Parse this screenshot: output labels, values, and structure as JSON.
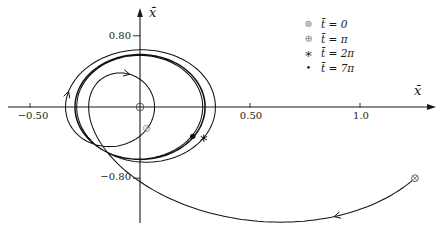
{
  "figure": {
    "background": "#ffffff",
    "ink_color": "#1a1a1a",
    "muted_color": "#8a8a8a"
  },
  "chart_data": {
    "type": "line",
    "subtype": "phase-plane-trajectory",
    "title": "",
    "xlabel": "x̄",
    "ylabel": "x̄̇",
    "xlim": [
      -0.6,
      1.35
    ],
    "ylim": [
      -1.3,
      1.09
    ],
    "grid": false,
    "legend_position": "top-right",
    "x_ticks": [
      {
        "value": -0.5,
        "label": "−0.50"
      },
      {
        "value": 0.5,
        "label": "0.50"
      },
      {
        "value": 1.0,
        "label": "1.0"
      }
    ],
    "y_ticks": [
      {
        "value": 0.8,
        "label": "0.80"
      },
      {
        "value": -0.8,
        "label": "−0.80"
      }
    ],
    "origin_marker": {
      "x": 0,
      "y": 0
    },
    "markers": [
      {
        "symbol": "circle-cross",
        "glyph": "⊗",
        "label": "t̄ = 0",
        "x": 1.25,
        "y": -0.8
      },
      {
        "symbol": "circle-plus",
        "glyph": "⊕",
        "label": "t̄ = π",
        "x": 0.03,
        "y": -0.24
      },
      {
        "symbol": "asterisk",
        "glyph": "∗",
        "label": "t̄ = 2π",
        "x": 0.29,
        "y": -0.35
      },
      {
        "symbol": "dot",
        "glyph": "•",
        "label": "t̄ = 7π",
        "x": 0.24,
        "y": -0.33
      }
    ],
    "trajectory": {
      "description": "Forced damped response: starts at (1.25, -0.80), sweeps along the bottom, loops near the origin, then converges clockwise onto the steady-state ellipse (x-amplitude 0.295, velocity amplitude 0.59) by t = 7π.",
      "steady_state": {
        "amplitude": 0.295,
        "omega": 2,
        "phase": 0.6
      },
      "transient": {
        "amplitude": 1.0066,
        "decay": 0.5,
        "omega_d": 1.0,
        "phase": -0.036
      },
      "t_start": 0,
      "t_end": 21.99,
      "dt": 0.02,
      "flow_arrows_t": [
        0.3,
        2.3,
        4.41
      ],
      "key_points": {
        "start": [
          1.25,
          -0.8
        ],
        "bottom_sweep_lowest": [
          0.65,
          -1.27
        ],
        "outer_loop_leftmost": [
          -0.35,
          0.1
        ],
        "steady_x_amplitude": 0.295,
        "steady_v_amplitude": 0.59
      }
    }
  }
}
